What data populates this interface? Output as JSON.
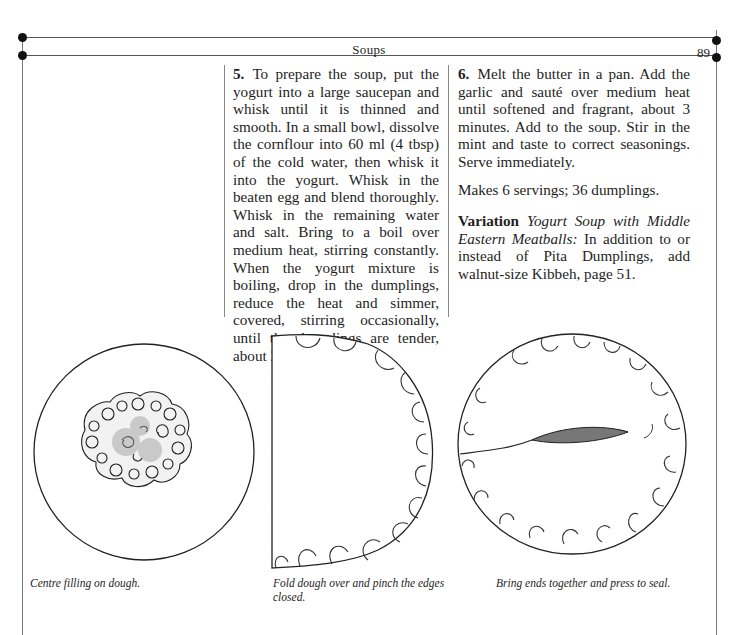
{
  "header": {
    "running_head": "Soups",
    "page_number": "89"
  },
  "body": {
    "left_column": {
      "step5": {
        "number": "5.",
        "text": "To prepare the soup, put the yogurt into a large saucepan and whisk until it is thinned and smooth. In a small bowl, dissolve the corn­flour into 60 ml (4 tbsp) of the cold water, then whisk it into the yogurt. Whisk in the beaten egg and blend thoroughly. Whisk in the remaining water and salt. Bring to a boil over medium heat, stirring constantly. When the yogurt mixture is boiling, drop in the dumplings, reduce the heat and simmer, covered, stirring occasionally, until the dumplings are tender, about 25 to 30 minutes."
      }
    },
    "right_column": {
      "step6": {
        "number": "6.",
        "text": "Melt the butter in a pan. Add the garlic and sauté over medium heat until softened and fragrant, about 3 minutes. Add to the soup. Stir in the mint and taste to correct seasonings. Serve immediately."
      },
      "yield": "Makes 6 servings; 36 dumplings.",
      "variation": {
        "label": "Variation",
        "title": "Yogurt Soup with Middle Eastern Meatballs:",
        "text": "In addition to or instead of Pita Dumplings, add walnut-size Kibbeh, page 51."
      }
    }
  },
  "figures": [
    {
      "name": "filling-on-dough",
      "caption": "Centre filling on dough."
    },
    {
      "name": "folded-dough",
      "caption": "Fold dough over and pinch the edges closed."
    },
    {
      "name": "sealed-dumpling",
      "caption": "Bring ends together and press to seal."
    }
  ],
  "colors": {
    "ink": "#1e1e1e",
    "rule": "#555555",
    "paper": "#ffffff"
  }
}
